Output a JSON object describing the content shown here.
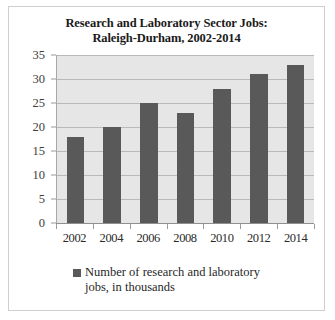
{
  "chart_data": {
    "type": "bar",
    "title": "Research and Laboratory Sector Jobs: Raleigh-Durham, 2002-2014",
    "title_lines": [
      "Research and Laboratory Sector Jobs:",
      "Raleigh-Durham, 2002-2014"
    ],
    "categories": [
      "2002",
      "2004",
      "2006",
      "2008",
      "2010",
      "2012",
      "2014"
    ],
    "values": [
      18,
      20,
      25,
      23,
      28,
      31,
      33
    ],
    "series": [
      {
        "name": "Number of research and laboratory jobs, in thousands",
        "values": [
          18,
          20,
          25,
          23,
          28,
          31,
          33
        ]
      }
    ],
    "xlabel": "",
    "ylabel": "",
    "ylim": [
      0,
      35
    ],
    "ytick_interval": 5,
    "yticks": [
      "0",
      "5",
      "10",
      "15",
      "20",
      "25",
      "30",
      "35"
    ],
    "grid": true,
    "legend_position": "bottom",
    "legend_entries": [
      {
        "label_lines": [
          "Number of research and laboratory",
          "jobs, in thousands"
        ],
        "label": "Number of research and laboratory jobs, in thousands",
        "color": "#595959"
      }
    ],
    "colors": {
      "bar": "#595959",
      "plot_background": "#e6e6e6",
      "gridline": "#b9b9b9",
      "axis": "#8f8f8f",
      "title_text": "#1a1a1a",
      "tick_text": "#3c3c3c",
      "figure_border": "#cfcfcf",
      "figure_background": "#ffffff"
    }
  }
}
